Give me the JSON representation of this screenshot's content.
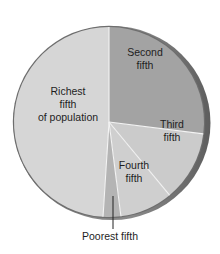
{
  "chart_data": {
    "type": "pie",
    "title": "",
    "start_angle_deg": 0,
    "direction": "clockwise",
    "categories": [
      "Second fifth",
      "Third fifth",
      "Fourth fifth",
      "Poorest fifth",
      "Richest fifth of population"
    ],
    "values": [
      27,
      12,
      9,
      3,
      49
    ],
    "unit": "percent of total (estimated from slice angles)",
    "slices": [
      {
        "key": "second",
        "label_lines": [
          "Second",
          "fifth"
        ],
        "value": 27,
        "color": "#a3a3a3",
        "label_pos": [
          145,
          62
        ]
      },
      {
        "key": "third",
        "label_lines": [
          "Third",
          "fifth"
        ],
        "value": 12,
        "color": "#cbcbcb",
        "label_pos": [
          172,
          134
        ]
      },
      {
        "key": "fourth",
        "label_lines": [
          "Fourth",
          "fifth"
        ],
        "value": 9,
        "color": "#cfcfcf",
        "label_pos": [
          134,
          175
        ]
      },
      {
        "key": "poorest",
        "label_lines": [
          "Poorest fifth"
        ],
        "value": 3,
        "color": "#b4b4b4",
        "label_pos": [
          110,
          240
        ],
        "external": true
      },
      {
        "key": "richest",
        "label_lines": [
          "Richest",
          "fifth",
          "of population"
        ],
        "value": 49,
        "color": "#d6d6d6",
        "label_pos": [
          68,
          108
        ]
      }
    ],
    "legend": null,
    "annotations": [
      "Poorest fifth (callout line)"
    ]
  },
  "style": {
    "background": "#ffffff",
    "rim_color": "#6e6e6e",
    "rim_highlight": "#9a9a9a",
    "divider_color": "#f4f4f4",
    "text_color": "#1e1e1e"
  },
  "geometry": {
    "cx": 109,
    "cy": 122,
    "r": 95
  }
}
